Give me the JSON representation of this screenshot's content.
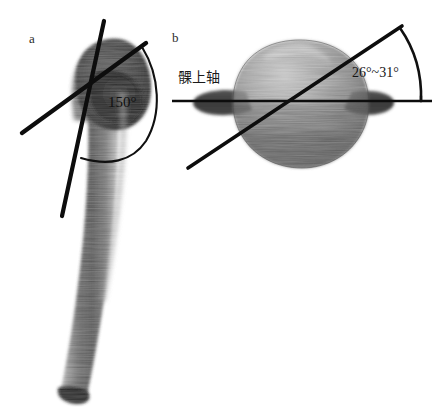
{
  "figure": {
    "background_color": "#ffffff",
    "width": 448,
    "height": 414
  },
  "panels": [
    {
      "id": "a",
      "label": "a",
      "description": "anteroposterior radiograph of proximal humerus with neck-shaft angle measurement",
      "annotations": {
        "angle_label": "150°"
      }
    },
    {
      "id": "b",
      "label": "b",
      "description": "axial view of proximal humerus showing humeral head retroversion relative to the epicondylar axis",
      "annotations": {
        "axis_label": "髁上轴",
        "angle_label": "26°~31°"
      }
    }
  ],
  "colors": {
    "line": "#0d0d0d",
    "arc": "#101010",
    "text": "#161616",
    "bone_dark": "#3a3a3a",
    "bone_mid": "#6e6e6e",
    "bone_light": "#a9a9a9",
    "background": "#ffffff"
  }
}
